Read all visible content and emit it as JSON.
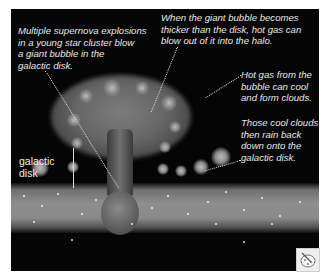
{
  "figure": {
    "type": "illustration"
  },
  "annotations": {
    "supernova": "Multiple supernova explosions\nin a young star cluster blow\na giant bubble in the\ngalactic disk.",
    "blowout": "When the giant bubble becomes\nthicker than the disk, hot gas can\nblow out of it into the halo.",
    "cooling": "Hot gas from the\nbubble can cool\nand form clouds.",
    "rain": "Those cool clouds\nthen rain back\ndown onto the\ngalactic disk.",
    "disk_label": "galactic\ndisk"
  },
  "controls": {
    "corner_icon": "palette-icon"
  },
  "colors": {
    "background": "#050505",
    "text": "#e8e8e8",
    "disk": "#8e8e8e",
    "page": "#ffffff"
  }
}
